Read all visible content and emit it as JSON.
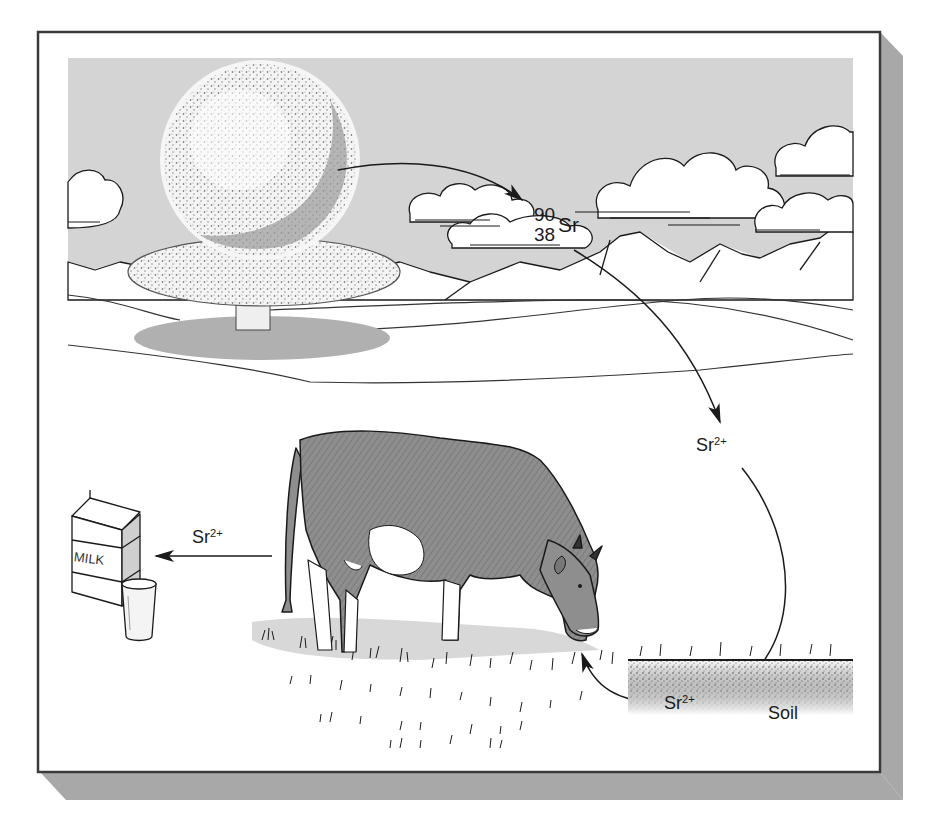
{
  "diagram": {
    "title": "",
    "nuclide": {
      "mass_number": "90",
      "atomic_number": "38",
      "symbol": "Sr"
    },
    "labels": {
      "air_ion": {
        "base": "Sr",
        "charge": "2+"
      },
      "soil_ion": {
        "base": "Sr",
        "charge": "2+"
      },
      "milk_ion": {
        "base": "Sr",
        "charge": "2+"
      },
      "soil": "Soil",
      "milk_carton": "MILK"
    },
    "flow": [
      {
        "from": "nuclear-explosion",
        "to": "atmosphere-clouds",
        "label": "90/38 Sr"
      },
      {
        "from": "atmosphere-clouds",
        "to": "fallout",
        "label": "Sr2+"
      },
      {
        "from": "fallout",
        "to": "soil",
        "label": ""
      },
      {
        "from": "soil",
        "to": "grass-eaten-by-cow",
        "label": "Sr2+"
      },
      {
        "from": "cow",
        "to": "milk",
        "label": "Sr2+"
      }
    ],
    "colors": {
      "sky": "#d4d4d4",
      "frame_border": "#3a3a3a",
      "shadow": "#a8a8a8",
      "cow": "#8e8e8e",
      "ink": "#1a1a1a",
      "soil_speckle": "#555555"
    }
  }
}
